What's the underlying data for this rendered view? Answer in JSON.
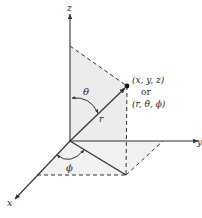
{
  "diagram": {
    "axes": {
      "x_label": "x",
      "y_label": "y",
      "z_label": "z"
    },
    "point": {
      "cartesian_label": "(x, y, z)",
      "connector": "or",
      "spherical_label": "(r, θ, ϕ)"
    },
    "radius_label": "r",
    "polar_angle_label": "θ",
    "azimuth_angle_label": "ϕ",
    "colors": {
      "line": "#333333",
      "shade": "#ececec",
      "background": "#ffffff"
    }
  }
}
